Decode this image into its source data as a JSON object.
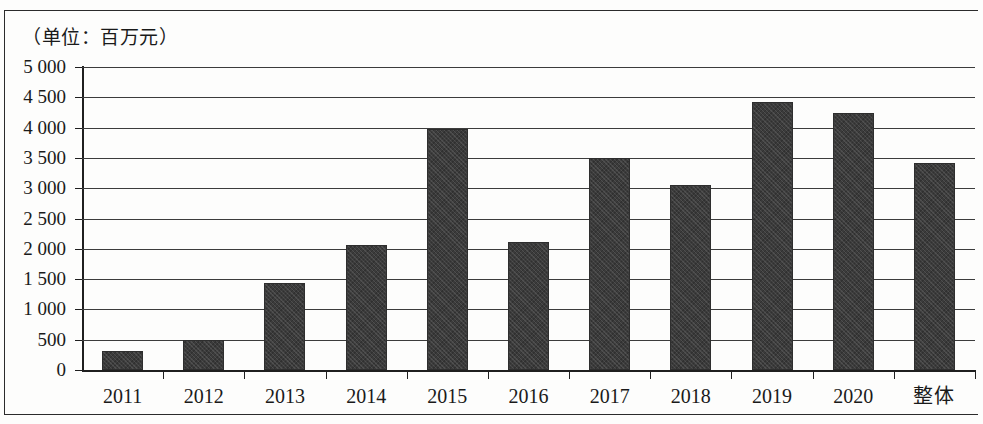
{
  "figure": {
    "unit_caption": "（单位：百万元）",
    "bar_color": "#3b3b3b",
    "axis_color": "#1f1f1f",
    "background_color": "#fdfdfc"
  },
  "chart_data": {
    "type": "bar",
    "title": "",
    "subtitle": "",
    "xlabel": "",
    "ylabel": "",
    "unit_note": "（单位：百万元）",
    "categories": [
      "2011",
      "2012",
      "2013",
      "2014",
      "2015",
      "2016",
      "2017",
      "2018",
      "2019",
      "2020",
      "整体"
    ],
    "values": [
      320,
      490,
      1440,
      2060,
      3980,
      2120,
      3500,
      3050,
      4430,
      4240,
      3410
    ],
    "series": [
      {
        "name": "",
        "values": [
          320,
          490,
          1440,
          2060,
          3980,
          2120,
          3500,
          3050,
          4430,
          4240,
          3410
        ]
      }
    ],
    "ylim": [
      0,
      5000
    ],
    "ytick_values": [
      0,
      500,
      1000,
      1500,
      2000,
      2500,
      3000,
      3500,
      4000,
      4500,
      5000
    ],
    "ytick_labels": [
      "0",
      "500",
      "1 000",
      "1 500",
      "2 000",
      "2 500",
      "3 000",
      "3 500",
      "4 000",
      "4 500",
      "5 000"
    ],
    "grid": true,
    "grid_axis": "y",
    "legend": false,
    "legend_position": "none"
  }
}
